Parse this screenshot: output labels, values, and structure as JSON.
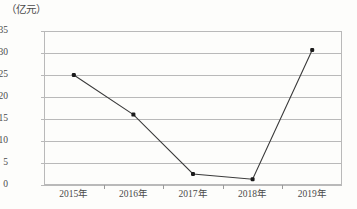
{
  "chart_data": {
    "type": "line",
    "title": "",
    "subtitle": "",
    "xlabel": "",
    "ylabel": "（亿元）",
    "y_unit_caption": "（亿元）",
    "categories": [
      "2015年",
      "2016年",
      "2017年",
      "2018年",
      "2019年"
    ],
    "values": [
      25,
      16,
      2.5,
      1.3,
      30.7
    ],
    "series": [
      {
        "name": "",
        "values": [
          25,
          16,
          2.5,
          1.3,
          30.7
        ]
      }
    ],
    "ylim": [
      0,
      35
    ],
    "ytick_step": 5,
    "yticks": [
      0,
      5,
      10,
      15,
      20,
      25,
      30,
      35
    ],
    "ytick_labels": [
      "0",
      "5",
      "10",
      "15",
      "20",
      "25",
      "30",
      "35"
    ],
    "grid": true,
    "grid_axis": "y",
    "legend": false,
    "legend_position": "none",
    "marker": "square",
    "annotations": []
  },
  "style": {
    "line_color": "#3a3a3a",
    "marker_color": "#1b1b1b",
    "grid_color": "#b9b9b9",
    "frame_color": "#b9b9b9",
    "text_color": "#4a4a4a",
    "background": "#fdfdfb"
  }
}
